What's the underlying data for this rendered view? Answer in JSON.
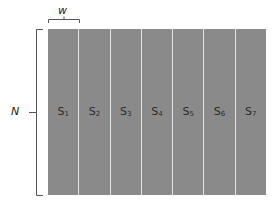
{
  "diagram": {
    "width_label": "w",
    "height_label": "N",
    "fill_color": "#8a8a8a",
    "divider_color": "#e4e4e4",
    "columns": [
      {
        "prefix": "S",
        "sub": "1"
      },
      {
        "prefix": "S",
        "sub": "2"
      },
      {
        "prefix": "S",
        "sub": "3"
      },
      {
        "prefix": "S",
        "sub": "4"
      },
      {
        "prefix": "S",
        "sub": "5"
      },
      {
        "prefix": "S",
        "sub": "6"
      },
      {
        "prefix": "S",
        "sub": "7"
      }
    ]
  }
}
